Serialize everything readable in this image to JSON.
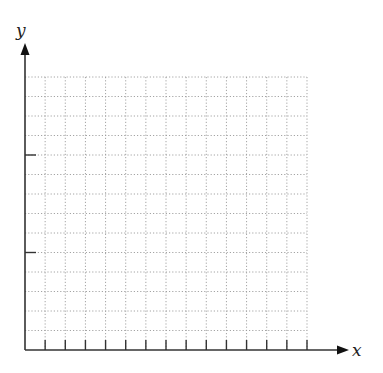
{
  "chart_data": {
    "type": "grid",
    "title": "",
    "xlabel": "x",
    "ylabel": "y",
    "grid": true,
    "grid_style": "dotted",
    "grid_columns": 14,
    "grid_rows": 14,
    "x_ticks_count": 14,
    "y_ticks_positions_rows_from_top": [
      4,
      9
    ],
    "x_tick_labels": [],
    "y_tick_labels": [],
    "series": []
  },
  "axes": {
    "x_label": "x",
    "y_label": "y"
  },
  "colors": {
    "axis": "#333333",
    "grid": "#9a9a9a",
    "background": "#ffffff"
  }
}
